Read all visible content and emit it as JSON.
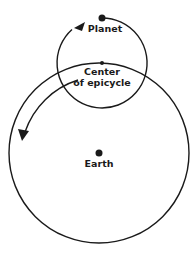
{
  "diagram": {
    "type": "epicycle-model",
    "labels": {
      "planet": "Planet",
      "center_line1": "Center",
      "center_line2": "of epicycle",
      "earth": "Earth"
    },
    "colors": {
      "stroke": "#1a1a1a",
      "background": "#ffffff"
    }
  }
}
